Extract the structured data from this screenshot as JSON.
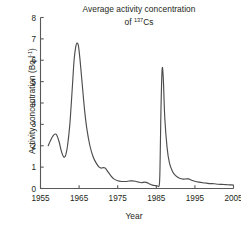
{
  "chart_data": {
    "type": "line",
    "title": "Average activity concentration of 137Cs",
    "title_line1": "Average activity concentration",
    "title_line2_prefix": "of ",
    "title_line2_sup": "137",
    "title_line2_suffix": "Cs",
    "xlabel": "Year",
    "ylabel": "Activity concentration (Bq l-1)",
    "ylabel_prefix": "Activity concentration (Bq l",
    "ylabel_sup": "-1",
    "ylabel_suffix": ")",
    "xlim": [
      1955,
      2005
    ],
    "ylim": [
      0,
      8
    ],
    "xticks": [
      1955,
      1965,
      1975,
      1985,
      1995,
      2005
    ],
    "xtick_labels": [
      "1955",
      "1965",
      "1975",
      "1985",
      "1995",
      "2005"
    ],
    "yticks": [
      0,
      1,
      2,
      3,
      4,
      5,
      6,
      7,
      8
    ],
    "ytick_labels": [
      "0",
      "1",
      "2",
      "3",
      "4",
      "5",
      "6",
      "7",
      "8"
    ],
    "grid": false,
    "legend": false,
    "line_color": "#4d4d4f",
    "axis_color": "#58595b",
    "series": [
      {
        "name": "137Cs activity concentration",
        "x": [
          1957.0,
          1957.6,
          1958.2,
          1958.8,
          1959.2,
          1959.8,
          1960.4,
          1961.0,
          1961.5,
          1962.0,
          1962.6,
          1963.2,
          1963.7,
          1964.1,
          1964.4,
          1964.8,
          1965.2,
          1965.8,
          1966.4,
          1967.0,
          1967.8,
          1968.6,
          1969.4,
          1970.2,
          1970.8,
          1971.3,
          1971.8,
          1972.4,
          1973.2,
          1974.0,
          1975.0,
          1976.0,
          1977.0,
          1978.0,
          1978.8,
          1979.6,
          1980.4,
          1981.2,
          1982.0,
          1982.8,
          1983.4,
          1984.0,
          1984.6,
          1985.2,
          1985.8,
          1986.0,
          1986.2,
          1986.5,
          1986.8,
          1987.2,
          1987.8,
          1988.4,
          1989.2,
          1990.0,
          1991.0,
          1992.0,
          1992.8,
          1993.4,
          1994.0,
          1995.0,
          1996.0,
          1997.0,
          1998.0,
          1999.0,
          2000.0,
          2001.0,
          2002.0,
          2003.0,
          2004.0,
          2005.0
        ],
        "y": [
          2.0,
          2.25,
          2.45,
          2.55,
          2.5,
          2.2,
          1.75,
          1.48,
          1.55,
          2.0,
          3.0,
          4.6,
          6.0,
          6.6,
          6.8,
          6.7,
          6.1,
          4.9,
          3.7,
          2.8,
          2.0,
          1.5,
          1.2,
          1.0,
          0.95,
          0.98,
          0.95,
          0.8,
          0.6,
          0.45,
          0.36,
          0.33,
          0.33,
          0.35,
          0.36,
          0.34,
          0.3,
          0.27,
          0.3,
          0.26,
          0.2,
          0.16,
          0.14,
          0.13,
          0.2,
          1.4,
          3.6,
          5.55,
          5.2,
          3.3,
          1.9,
          1.2,
          0.8,
          0.6,
          0.48,
          0.44,
          0.45,
          0.45,
          0.4,
          0.34,
          0.3,
          0.27,
          0.25,
          0.23,
          0.22,
          0.2,
          0.19,
          0.18,
          0.17,
          0.16
        ]
      }
    ]
  }
}
